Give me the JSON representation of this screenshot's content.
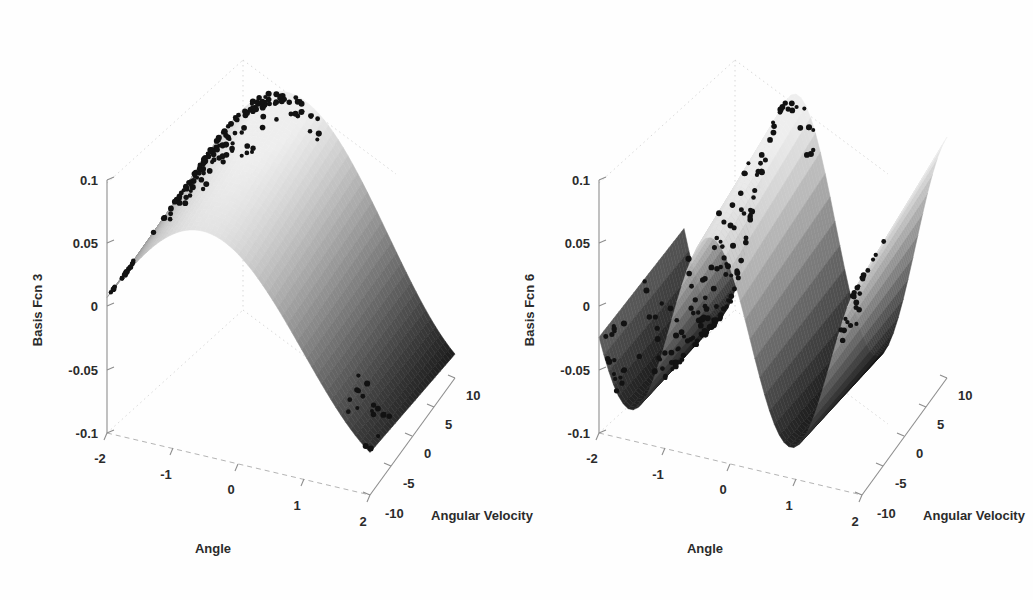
{
  "figure": {
    "background_color": "#ffffff",
    "panel_count": 2
  },
  "chart_data": [
    {
      "type": "surface",
      "panel": "left",
      "title": "",
      "zlabel": "Basis Fcn 3",
      "xlabel": "Angle",
      "ylabel": "Angular Velocity",
      "xlim": [
        -2,
        2
      ],
      "ylim": [
        -10,
        10
      ],
      "zlim": [
        -0.1,
        0.1
      ],
      "xticks": [
        "-2",
        "-1",
        "0",
        "1",
        "2"
      ],
      "xtick_values": [
        -2,
        -1,
        0,
        1,
        2
      ],
      "yticks": [
        "-10",
        "-5",
        "0",
        "5",
        "10"
      ],
      "ytick_values": [
        -10,
        -5,
        0,
        5,
        10
      ],
      "zticks": [
        "0.1",
        "0.05",
        "0",
        "-0.05",
        "-0.1"
      ],
      "ztick_values": [
        0.1,
        0.05,
        0,
        -0.05,
        -0.1
      ],
      "grid": true,
      "colormap": "gray",
      "surface_description": "single broad ridge, one oscillation across Angle, sharp fold at high Angle",
      "overlay": "black scatter of sampled state points",
      "scatter_point_count": 190,
      "frequency": 1,
      "amplitude": 0.085
    },
    {
      "type": "surface",
      "panel": "right",
      "title": "",
      "zlabel": "Basis Fcn 6",
      "xlabel": "Angle",
      "ylabel": "Angular Velocity",
      "xlim": [
        -2,
        2
      ],
      "ylim": [
        -10,
        10
      ],
      "zlim": [
        -0.1,
        0.1
      ],
      "xticks": [
        "-2",
        "-1",
        "0",
        "1",
        "2"
      ],
      "xtick_values": [
        -2,
        -1,
        0,
        1,
        2
      ],
      "yticks": [
        "-10",
        "-5",
        "0",
        "5",
        "10"
      ],
      "ytick_values": [
        -10,
        -5,
        0,
        5,
        10
      ],
      "zticks": [
        "0.1",
        "0.05",
        "0",
        "-0.05",
        "-0.1"
      ],
      "ztick_values": [
        0.1,
        0.05,
        0,
        -0.05,
        -0.1
      ],
      "grid": true,
      "colormap": "gray",
      "surface_description": "higher-frequency oscillating surface with two folded ridges overlapping in projection",
      "overlay": "black scatter of sampled state points",
      "scatter_point_count": 190,
      "frequency": 2.6,
      "amplitude": 0.085
    }
  ],
  "panels": {
    "left": {
      "zlabel": "Basis Fcn 3",
      "xlabel": "Angle",
      "ylabel": "Angular Velocity",
      "zticks": [
        "0.1",
        "0.05",
        "0",
        "-0.05",
        "-0.1"
      ],
      "xticks": [
        "-2",
        "-1",
        "0",
        "1",
        "2"
      ],
      "yticks": [
        "-10",
        "-5",
        "0",
        "5",
        "10"
      ]
    },
    "right": {
      "zlabel": "Basis Fcn 6",
      "xlabel": "Angle",
      "ylabel": "Angular Velocity",
      "zticks": [
        "0.1",
        "0.05",
        "0",
        "-0.05",
        "-0.1"
      ],
      "xticks": [
        "-2",
        "-1",
        "0",
        "1",
        "2"
      ],
      "yticks": [
        "-10",
        "-5",
        "0",
        "5",
        "10"
      ]
    }
  }
}
